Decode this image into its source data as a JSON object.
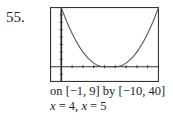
{
  "problem": {
    "number": "55."
  },
  "caption": {
    "window": "on [−1, 9] by [−10, 40]",
    "x1_var": "x",
    "x1_eq": " = 4, ",
    "x2_var": "x",
    "x2_eq": " = 5"
  },
  "chart_data": {
    "type": "line",
    "title": "",
    "xlabel": "",
    "ylabel": "",
    "xlim": [
      -1,
      9
    ],
    "ylim": [
      -10,
      40
    ],
    "grid": false,
    "axes_ticks": {
      "x_step": 1,
      "y_step": 5
    },
    "annotations": [
      "on [-1, 9] by [-10, 40]",
      "x = 4, x = 5"
    ],
    "series": [
      {
        "name": "graph",
        "x": [
          0,
          0.5,
          1,
          1.5,
          2,
          2.5,
          3,
          3.5,
          4,
          4.5,
          5,
          5.5,
          6,
          6.5,
          7,
          7.5,
          8,
          8.5,
          9
        ],
        "y": [
          40,
          30.6,
          22.5,
          15.6,
          10,
          5.6,
          2.5,
          0.6,
          0,
          0,
          0,
          0.6,
          2.5,
          5.6,
          10,
          15.6,
          22.5,
          30.6,
          40
        ]
      }
    ],
    "zeros": [
      4,
      5
    ]
  }
}
